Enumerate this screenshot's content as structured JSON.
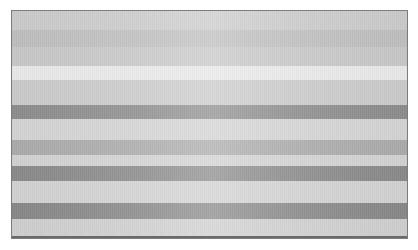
{
  "page": {
    "background_color": "#ffffff",
    "width": 418,
    "height": 250
  },
  "figure": {
    "name": "grayscale-horizontal-band-image",
    "x": 11,
    "y": 10,
    "width": 397,
    "height": 229,
    "border_color": "#7d7d7d",
    "bottom_rule": {
      "color": "#6a6a6a",
      "height": 3
    },
    "bands": [
      {
        "index": 0,
        "top": 0,
        "height": 20,
        "color": "#c9c9c9",
        "tone": "light-mid-gray"
      },
      {
        "index": 1,
        "top": 20,
        "height": 17,
        "color": "#bdbdbd",
        "tone": "mid-gray"
      },
      {
        "index": 2,
        "top": 37,
        "height": 19,
        "color": "#c6c6c6",
        "tone": "light-mid-gray"
      },
      {
        "index": 3,
        "top": 56,
        "height": 14,
        "color": "#e7e7e7",
        "tone": "near-white-highlight"
      },
      {
        "index": 4,
        "top": 70,
        "height": 25,
        "color": "#c9c9c9",
        "tone": "light-mid-gray"
      },
      {
        "index": 5,
        "top": 95,
        "height": 14,
        "color": "#8b8b8b",
        "tone": "dark-gray"
      },
      {
        "index": 6,
        "top": 109,
        "height": 21,
        "color": "#d2d2d2",
        "tone": "light-gray"
      },
      {
        "index": 7,
        "top": 130,
        "height": 15,
        "color": "#a9a9a9",
        "tone": "mid-gray"
      },
      {
        "index": 8,
        "top": 145,
        "height": 11,
        "color": "#d0d0d0",
        "tone": "light-gray"
      },
      {
        "index": 9,
        "top": 156,
        "height": 15,
        "color": "#888888",
        "tone": "dark-gray"
      },
      {
        "index": 10,
        "top": 171,
        "height": 22,
        "color": "#d0d0d0",
        "tone": "light-gray"
      },
      {
        "index": 11,
        "top": 193,
        "height": 16,
        "color": "#868686",
        "tone": "dark-gray"
      },
      {
        "index": 12,
        "top": 209,
        "height": 17,
        "color": "#cdcdcd",
        "tone": "light-gray"
      }
    ]
  }
}
